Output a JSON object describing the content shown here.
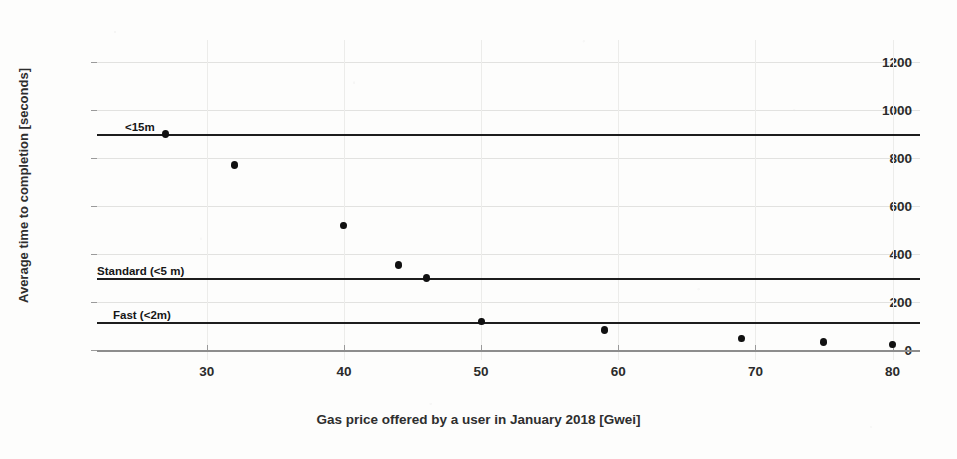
{
  "chart_data": {
    "type": "scatter",
    "title": "",
    "xlabel": "Gas price offered by a user in January 2018 [Gwei]",
    "ylabel": "Average time to completion [seconds]",
    "xlim": [
      22,
      82
    ],
    "ylim": [
      -40,
      1290
    ],
    "grid": true,
    "legend": "none",
    "xticks": [
      30,
      40,
      50,
      60,
      70,
      80
    ],
    "xtick_labels": [
      "30",
      "40",
      "50",
      "60",
      "70",
      "80"
    ],
    "yticks": [
      0,
      200,
      400,
      600,
      800,
      1000,
      1200
    ],
    "ytick_labels": [
      "0",
      "200",
      "400",
      "600",
      "800",
      "1000",
      "1200"
    ],
    "series": [
      {
        "name": "Average time to completion",
        "marker": "circle",
        "color": "#111111",
        "x": [
          27,
          32,
          40,
          44,
          46,
          50,
          59,
          69,
          75,
          80
        ],
        "y": [
          900,
          770,
          520,
          355,
          300,
          120,
          85,
          50,
          35,
          25
        ]
      }
    ],
    "reference_lines": [
      {
        "label": "<15m",
        "value": 900,
        "color": "#1d1d1d"
      },
      {
        "label": "Standard (<5 m)",
        "value": 300,
        "color": "#1d1d1d"
      },
      {
        "label": "Fast (<2m)",
        "value": 120,
        "color": "#1d1d1d"
      }
    ]
  }
}
